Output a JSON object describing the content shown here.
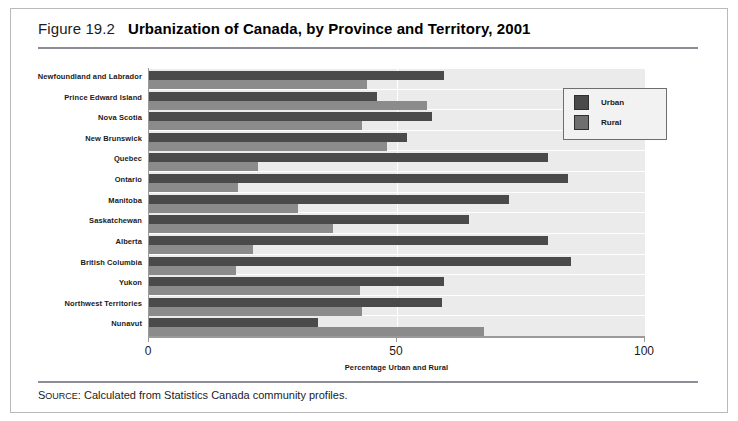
{
  "figure": {
    "number": "Figure 19.2",
    "title": "Urbanization of Canada, by Province and Territory, 2001",
    "source_prefix": "S",
    "source_prefix_rest": "OURCE",
    "source_text": ": Calculated from Statistics Canada community profiles."
  },
  "legend": {
    "urban_label": "Urban",
    "rural_label": "Rural"
  },
  "colors": {
    "urban": "#4a4a4a",
    "rural": "#8b8b8b",
    "plot_background": "#ebebeb",
    "gridline": "#ffffff",
    "frame": "#b9b9b9",
    "rule": "#8d8d96"
  },
  "chart_data": {
    "type": "bar",
    "orientation": "horizontal",
    "title": "Urbanization of Canada, by Province and Territory, 2001",
    "xlabel": "Percentage Urban and Rural",
    "ylabel": "",
    "xlim": [
      0,
      100
    ],
    "xticks": [
      0,
      50,
      100
    ],
    "xtick_labels": [
      "0",
      "50",
      "100"
    ],
    "grid": true,
    "legend_position": "top-right",
    "categories": [
      "Newfoundland and Labrador",
      "Prince Edward Island",
      "Nova Scotia",
      "New Brunswick",
      "Quebec",
      "Ontario",
      "Manitoba",
      "Saskatchewan",
      "Alberta",
      "British Columbia",
      "Yukon",
      "Northwest Territories",
      "Nunavut"
    ],
    "series": [
      {
        "name": "Urban",
        "color": "#4a4a4a",
        "values": [
          59.5,
          46,
          57,
          52,
          80.5,
          84.5,
          72.5,
          64.5,
          80.5,
          85,
          59.5,
          59,
          34
        ]
      },
      {
        "name": "Rural",
        "color": "#8b8b8b",
        "values": [
          44,
          56,
          43,
          48,
          22,
          18,
          30,
          37,
          21,
          17.5,
          42.5,
          43,
          67.5
        ]
      }
    ]
  }
}
